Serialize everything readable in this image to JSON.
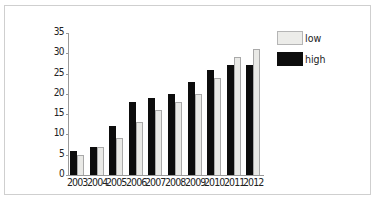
{
  "chart_data": {
    "type": "bar",
    "title": "",
    "xlabel": "",
    "ylabel": "",
    "categories": [
      "2003",
      "2004",
      "2005",
      "2006",
      "2007",
      "2008",
      "2009",
      "2010",
      "2011",
      "2012"
    ],
    "series": [
      {
        "name": "high",
        "color": "#0d0d0d",
        "values": [
          6,
          7,
          12,
          18,
          19,
          20,
          23,
          26,
          27,
          27
        ]
      },
      {
        "name": "low",
        "color": "#e9e9e6",
        "values": [
          5,
          7,
          9,
          13,
          16,
          18,
          20,
          24,
          29,
          31
        ]
      }
    ],
    "ylim": [
      0,
      35
    ],
    "yticks": [
      "0",
      "5",
      "10",
      "15",
      "20",
      "25",
      "30",
      "35"
    ],
    "grid": false,
    "legend_position": "top-right"
  },
  "legend": {
    "items": [
      {
        "label": "low"
      },
      {
        "label": "high"
      }
    ]
  }
}
